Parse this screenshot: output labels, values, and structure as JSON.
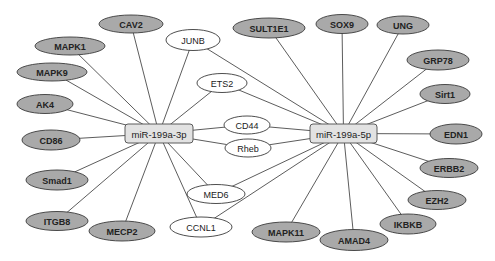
{
  "diagram": {
    "colors": {
      "target_fill": "#a9a9a9",
      "shared_fill": "#ffffff",
      "mirna_fill": "#e2e2e2",
      "edge": "#4a4a4a",
      "text": "#222222"
    },
    "hubs": [
      {
        "id": "mir3p",
        "label": "miR-199a-3p",
        "x": 159,
        "y": 133.5,
        "w": 68,
        "h": 19
      },
      {
        "id": "mir5p",
        "label": "miR-199a-5p",
        "x": 343.5,
        "y": 133.5,
        "w": 67,
        "h": 19
      }
    ],
    "nodes": [
      {
        "id": "CAV2",
        "label": "CAV2",
        "type": "target",
        "x": 131,
        "y": 24,
        "rx": 32,
        "ry": 9
      },
      {
        "id": "MAPK1",
        "label": "MAPK1",
        "type": "target",
        "x": 70,
        "y": 46,
        "rx": 35,
        "ry": 9
      },
      {
        "id": "MAPK9",
        "label": "MAPK9",
        "type": "target",
        "x": 52,
        "y": 72,
        "rx": 35,
        "ry": 9
      },
      {
        "id": "AK4",
        "label": "AK4",
        "type": "target",
        "x": 45,
        "y": 104,
        "rx": 28,
        "ry": 9.5
      },
      {
        "id": "CD86",
        "label": "CD86",
        "type": "target",
        "x": 51,
        "y": 140,
        "rx": 29,
        "ry": 10
      },
      {
        "id": "Smad1",
        "label": "Smad1",
        "type": "target",
        "x": 57,
        "y": 180,
        "rx": 31,
        "ry": 10
      },
      {
        "id": "ITGB8",
        "label": "ITGB8",
        "type": "target",
        "x": 57,
        "y": 221,
        "rx": 31,
        "ry": 9.5
      },
      {
        "id": "MECP2",
        "label": "MECP2",
        "type": "target",
        "x": 122,
        "y": 231,
        "rx": 33,
        "ry": 10
      },
      {
        "id": "JUNB",
        "label": "JUNB",
        "type": "shared",
        "x": 193,
        "y": 40,
        "rx": 27,
        "ry": 10.5
      },
      {
        "id": "ETS2",
        "label": "ETS2",
        "type": "shared",
        "x": 222,
        "y": 83,
        "rx": 25,
        "ry": 9.5
      },
      {
        "id": "CD44",
        "label": "CD44",
        "type": "shared",
        "x": 247,
        "y": 125,
        "rx": 23,
        "ry": 9
      },
      {
        "id": "Rheb",
        "label": "Rheb",
        "type": "shared",
        "x": 248,
        "y": 148,
        "rx": 23,
        "ry": 9
      },
      {
        "id": "MED6",
        "label": "MED6",
        "type": "shared",
        "x": 216,
        "y": 194,
        "rx": 29,
        "ry": 9.5
      },
      {
        "id": "CCNL1",
        "label": "CCNL1",
        "type": "shared",
        "x": 201,
        "y": 227,
        "rx": 31,
        "ry": 10
      },
      {
        "id": "SULT1E1",
        "label": "SULT1E1",
        "type": "target",
        "x": 269,
        "y": 28,
        "rx": 36,
        "ry": 10
      },
      {
        "id": "SOX9",
        "label": "SOX9",
        "type": "target",
        "x": 342,
        "y": 24,
        "rx": 26,
        "ry": 9.5
      },
      {
        "id": "UNG",
        "label": "UNG",
        "type": "target",
        "x": 403,
        "y": 25,
        "rx": 26,
        "ry": 9
      },
      {
        "id": "GRP78",
        "label": "GRP78",
        "type": "target",
        "x": 438,
        "y": 60,
        "rx": 31,
        "ry": 10
      },
      {
        "id": "Sirt1",
        "label": "Sirt1",
        "type": "target",
        "x": 445,
        "y": 94,
        "rx": 25,
        "ry": 9.5
      },
      {
        "id": "EDN1",
        "label": "EDN1",
        "type": "target",
        "x": 456,
        "y": 134,
        "rx": 26,
        "ry": 10
      },
      {
        "id": "ERBB2",
        "label": "ERBB2",
        "type": "target",
        "x": 449,
        "y": 168,
        "rx": 29,
        "ry": 9.5
      },
      {
        "id": "EZH2",
        "label": "EZH2",
        "type": "target",
        "x": 437,
        "y": 200,
        "rx": 29,
        "ry": 9.5
      },
      {
        "id": "IKBKB",
        "label": "IKBKB",
        "type": "target",
        "x": 408,
        "y": 224,
        "rx": 28,
        "ry": 10
      },
      {
        "id": "AMAD4",
        "label": "AMAD4",
        "type": "target",
        "x": 354,
        "y": 240,
        "rx": 34,
        "ry": 10.5
      },
      {
        "id": "MAPK11",
        "label": "MAPK11",
        "type": "target",
        "x": 286,
        "y": 232,
        "rx": 34,
        "ry": 10
      }
    ],
    "edges": [
      {
        "from": "mir3p",
        "to": "CAV2"
      },
      {
        "from": "mir3p",
        "to": "MAPK1"
      },
      {
        "from": "mir3p",
        "to": "MAPK9"
      },
      {
        "from": "mir3p",
        "to": "AK4"
      },
      {
        "from": "mir3p",
        "to": "CD86"
      },
      {
        "from": "mir3p",
        "to": "Smad1"
      },
      {
        "from": "mir3p",
        "to": "ITGB8"
      },
      {
        "from": "mir3p",
        "to": "MECP2"
      },
      {
        "from": "mir3p",
        "to": "JUNB"
      },
      {
        "from": "mir3p",
        "to": "ETS2"
      },
      {
        "from": "mir3p",
        "to": "CD44"
      },
      {
        "from": "mir3p",
        "to": "Rheb"
      },
      {
        "from": "mir3p",
        "to": "MED6"
      },
      {
        "from": "mir3p",
        "to": "CCNL1"
      },
      {
        "from": "mir5p",
        "to": "JUNB"
      },
      {
        "from": "mir5p",
        "to": "ETS2"
      },
      {
        "from": "mir5p",
        "to": "CD44"
      },
      {
        "from": "mir5p",
        "to": "Rheb"
      },
      {
        "from": "mir5p",
        "to": "MED6"
      },
      {
        "from": "mir5p",
        "to": "CCNL1"
      },
      {
        "from": "mir5p",
        "to": "SULT1E1"
      },
      {
        "from": "mir5p",
        "to": "SOX9"
      },
      {
        "from": "mir5p",
        "to": "UNG"
      },
      {
        "from": "mir5p",
        "to": "GRP78"
      },
      {
        "from": "mir5p",
        "to": "Sirt1"
      },
      {
        "from": "mir5p",
        "to": "EDN1"
      },
      {
        "from": "mir5p",
        "to": "ERBB2"
      },
      {
        "from": "mir5p",
        "to": "EZH2"
      },
      {
        "from": "mir5p",
        "to": "IKBKB"
      },
      {
        "from": "mir5p",
        "to": "AMAD4"
      },
      {
        "from": "mir5p",
        "to": "MAPK11"
      }
    ]
  }
}
